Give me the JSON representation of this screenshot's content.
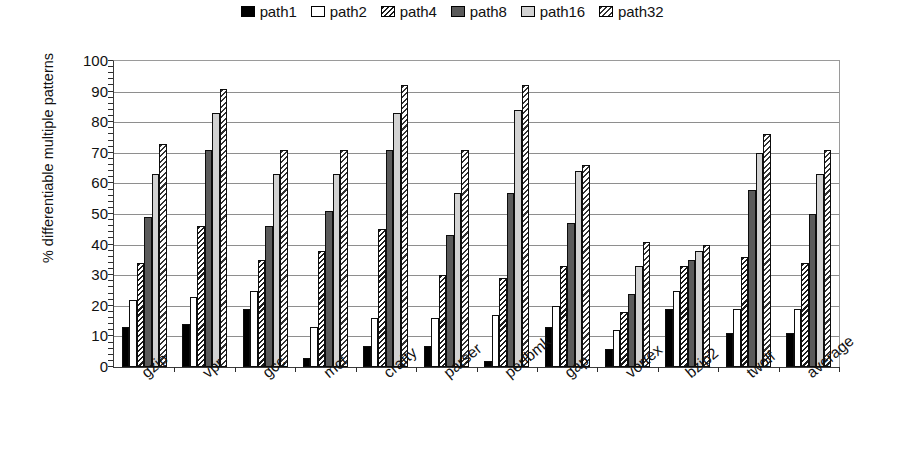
{
  "chart_data": {
    "type": "bar",
    "title": "",
    "xlabel": "",
    "ylabel": "% differentiable multiple patterns",
    "ylim": [
      0,
      100
    ],
    "ytick_step": 10,
    "yticks": [
      0,
      10,
      20,
      30,
      40,
      50,
      60,
      70,
      80,
      90,
      100
    ],
    "grid": true,
    "legend_position": "top-center",
    "categories": [
      "gzip",
      "vpr",
      "gcc",
      "mcf",
      "crafty",
      "parser",
      "perlbmk",
      "gap",
      "vortex",
      "bzip2",
      "twolf",
      "average"
    ],
    "series": [
      {
        "name": "path1",
        "fill": "solid-black",
        "color": "#000000",
        "values": [
          13,
          14,
          19,
          3,
          7,
          7,
          2,
          13,
          6,
          19,
          11,
          11
        ]
      },
      {
        "name": "path2",
        "fill": "solid-white",
        "color": "#ffffff",
        "values": [
          22,
          23,
          25,
          13,
          16,
          16,
          17,
          20,
          12,
          25,
          19,
          19
        ]
      },
      {
        "name": "path4",
        "fill": "diagonal-hatch",
        "color": "#e8e8e8",
        "values": [
          34,
          46,
          35,
          38,
          45,
          30,
          29,
          33,
          18,
          33,
          36,
          34
        ]
      },
      {
        "name": "path8",
        "fill": "solid-dark-gray",
        "color": "#5a5a5a",
        "values": [
          49,
          71,
          46,
          51,
          71,
          43,
          57,
          47,
          24,
          35,
          58,
          50
        ]
      },
      {
        "name": "path16",
        "fill": "solid-light-gray",
        "color": "#d2d2d2",
        "values": [
          63,
          83,
          63,
          63,
          83,
          57,
          84,
          64,
          33,
          38,
          70,
          63
        ]
      },
      {
        "name": "path32",
        "fill": "diagonal-hatch-2",
        "color": "#ededed",
        "values": [
          73,
          91,
          71,
          71,
          92,
          71,
          92,
          66,
          41,
          40,
          76,
          71
        ]
      }
    ]
  },
  "legend": {
    "entries": [
      {
        "label": "path1"
      },
      {
        "label": "path2"
      },
      {
        "label": "path4"
      },
      {
        "label": "path8"
      },
      {
        "label": "path16"
      },
      {
        "label": "path32"
      }
    ]
  }
}
